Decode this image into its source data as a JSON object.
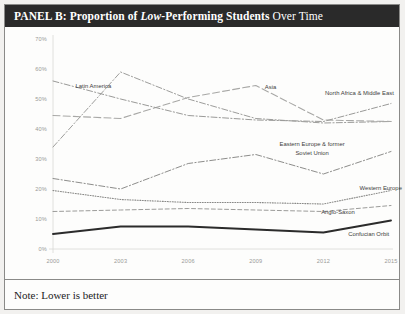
{
  "panel": {
    "title_prefix": "PANEL B: Proportion of ",
    "title_emphasis": "Low",
    "title_middle": "-Performing Students ",
    "title_suffix": "Over Time",
    "note": "Note: Lower is better"
  },
  "chart_data": {
    "type": "line",
    "title": "PANEL B: Proportion of Low-Performing Students Over Time",
    "xlabel": "",
    "ylabel": "",
    "x": [
      2000,
      2003,
      2006,
      2009,
      2012,
      2015
    ],
    "xtick_labels": [
      "2000",
      "2003",
      "2006",
      "2009",
      "2012",
      "2015"
    ],
    "ytick_labels": [
      "0%",
      "10%",
      "20%",
      "30%",
      "40%",
      "50%",
      "60%",
      "70%"
    ],
    "yticks": [
      0,
      10,
      20,
      30,
      40,
      50,
      60,
      70
    ],
    "ylim": [
      0,
      70
    ],
    "xlim": [
      2000,
      2015
    ],
    "grid": false,
    "legend": "inline-labels",
    "units": "percent",
    "series": [
      {
        "name": "Latin America",
        "values": [
          34.0,
          59.0,
          50.0,
          43.5,
          42.0,
          42.5
        ],
        "style": "dash-dot",
        "color": "#9d9d9b",
        "width": 1.0,
        "label_x": 2001.0,
        "label_y": 54.5
      },
      {
        "name": "Asia",
        "values": [
          44.5,
          43.5,
          50.5,
          54.5,
          43.0,
          42.5
        ],
        "style": "long-dash",
        "color": "#a8a8a6",
        "width": 1.1,
        "label_x": 2009.4,
        "label_y": 54.0
      },
      {
        "name": "North Africa & Middle East",
        "values": [
          56.0,
          50.0,
          44.5,
          43.0,
          42.5,
          48.5
        ],
        "style": "dash-dot",
        "color": "#9a9a98",
        "width": 1.0,
        "label_x": 2013.6,
        "label_y": 52.0
      },
      {
        "name": "Eastern Europe & former Soviet Union",
        "values": [
          23.5,
          20.0,
          28.5,
          31.5,
          25.0,
          32.5
        ],
        "style": "dash-dot",
        "color": "#8d8d8b",
        "width": 1.0,
        "label_x": 2011.5,
        "label_y": 35.0
      },
      {
        "name": "Western Europe",
        "values": [
          19.5,
          16.5,
          15.5,
          15.5,
          15.0,
          19.5
        ],
        "style": "dotted",
        "color": "#8a8a88",
        "width": 1.1,
        "label_x": 2013.6,
        "label_y": 20.5
      },
      {
        "name": "Anglo-Saxon",
        "values": [
          12.5,
          13.0,
          13.5,
          13.0,
          12.5,
          14.5
        ],
        "style": "dashed",
        "color": "#9c9c9a",
        "width": 1.0,
        "label_x": 2011.9,
        "label_y": 12.2
      },
      {
        "name": "Confucian Orbit",
        "values": [
          5.0,
          7.5,
          7.5,
          6.5,
          5.5,
          9.5
        ],
        "style": "solid",
        "color": "#2b2b2b",
        "width": 1.9,
        "label_x": 2013.1,
        "label_y": 5.0
      }
    ]
  }
}
